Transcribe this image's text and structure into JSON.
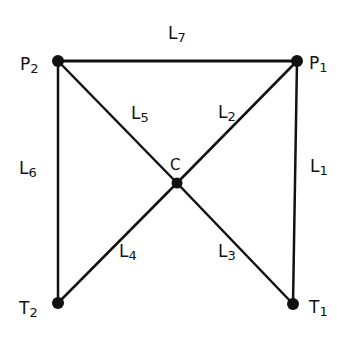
{
  "diagram": {
    "type": "graph",
    "nodes": [
      {
        "id": "P1",
        "letter": "P",
        "sub": "1",
        "x": 297,
        "y": 61
      },
      {
        "id": "P2",
        "letter": "P",
        "sub": "2",
        "x": 58,
        "y": 61
      },
      {
        "id": "T1",
        "letter": "T",
        "sub": "1",
        "x": 293,
        "y": 304
      },
      {
        "id": "T2",
        "letter": "T",
        "sub": "2",
        "x": 58,
        "y": 303
      },
      {
        "id": "C",
        "letter": "C",
        "sub": "",
        "x": 177,
        "y": 183
      }
    ],
    "edges": [
      {
        "id": "L1",
        "letter": "L",
        "sub": "1",
        "from": "P1",
        "to": "T1"
      },
      {
        "id": "L2",
        "letter": "L",
        "sub": "2",
        "from": "C",
        "to": "P1"
      },
      {
        "id": "L3",
        "letter": "L",
        "sub": "3",
        "from": "C",
        "to": "T1"
      },
      {
        "id": "L4",
        "letter": "L",
        "sub": "4",
        "from": "C",
        "to": "T2"
      },
      {
        "id": "L5",
        "letter": "L",
        "sub": "5",
        "from": "P2",
        "to": "C"
      },
      {
        "id": "L6",
        "letter": "L",
        "sub": "6",
        "from": "P2",
        "to": "T2"
      },
      {
        "id": "L7",
        "letter": "L",
        "sub": "7",
        "from": "P2",
        "to": "P1"
      }
    ],
    "colors": {
      "line": "#111111",
      "node": "#111111",
      "background": "#ffffff"
    }
  }
}
